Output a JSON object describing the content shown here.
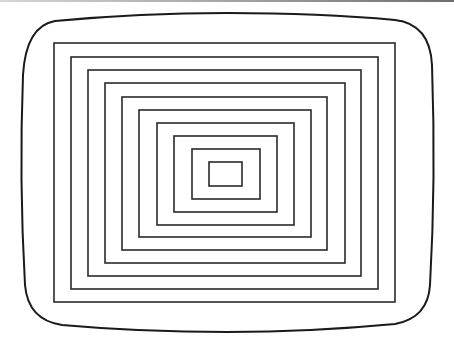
{
  "figure": {
    "width": 454,
    "height": 346,
    "stroke_color": "#2a2a2a",
    "outline_color": "#1a1a1a",
    "top_bar_color": "#8a8a8a"
  },
  "screen_outline": {
    "path": "M 55 21 Q 140 13 227 13 Q 320 13 395 20 Q 430 24 432 65 Q 436 180 430 285 Q 428 318 395 324 Q 310 332 227 332 Q 140 332 62 325 Q 28 320 25 285 Q 19 180 23 75 Q 26 26 55 21 Z"
  },
  "rectangles": [
    {
      "x1": 54,
      "y1": 43,
      "x2": 395,
      "y2": 302
    },
    {
      "x1": 71,
      "y1": 57,
      "x2": 378,
      "y2": 289
    },
    {
      "x1": 88,
      "y1": 70,
      "x2": 361,
      "y2": 276
    },
    {
      "x1": 105,
      "y1": 83,
      "x2": 345,
      "y2": 263
    },
    {
      "x1": 122,
      "y1": 97,
      "x2": 327,
      "y2": 250
    },
    {
      "x1": 139,
      "y1": 110,
      "x2": 311,
      "y2": 237
    },
    {
      "x1": 157,
      "y1": 123,
      "x2": 294,
      "y2": 225
    },
    {
      "x1": 174,
      "y1": 136,
      "x2": 277,
      "y2": 212
    },
    {
      "x1": 192,
      "y1": 149,
      "x2": 260,
      "y2": 199
    },
    {
      "x1": 209,
      "y1": 162,
      "x2": 242,
      "y2": 186
    }
  ]
}
